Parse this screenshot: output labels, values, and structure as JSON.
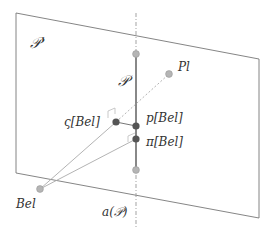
{
  "diagram": {
    "labels": {
      "outer_plane": "𝒫'",
      "inner_set": "𝒫",
      "pl": "Pl",
      "zeta_bel": "ς[Bel]",
      "p_bel": "p[Bel]",
      "pi_bel": "π[Bel]",
      "bel": "Bel",
      "affine_hull": "a(𝒫)"
    },
    "colors": {
      "line": "#888888",
      "plane_edge": "#777777",
      "light_point": "#b5b5b5",
      "dark_point": "#555555",
      "text": "#333333"
    },
    "points": {
      "upper_endpoint": [
        136,
        54
      ],
      "lower_endpoint": [
        136,
        170
      ],
      "pl": [
        169,
        74
      ],
      "zeta_bel": [
        116,
        122
      ],
      "p_bel": [
        136,
        126
      ],
      "pi_bel": [
        136,
        139
      ],
      "bel": [
        40,
        189
      ]
    }
  }
}
